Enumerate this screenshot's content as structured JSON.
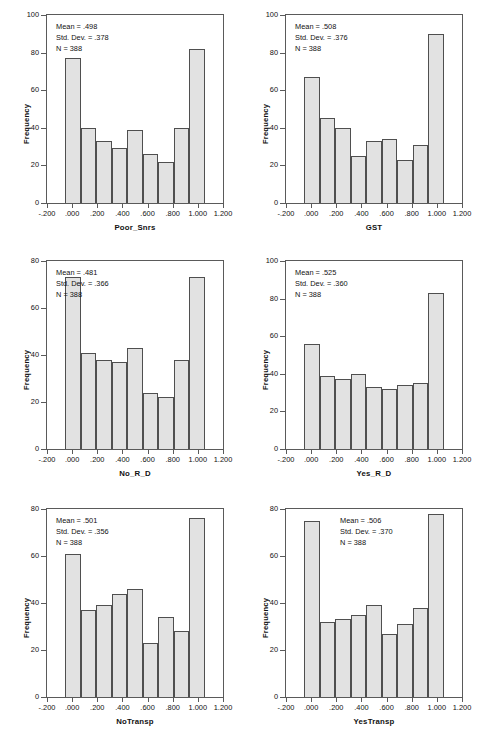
{
  "figure": {
    "kind": "histogram-grid",
    "rows": 3,
    "cols": 2,
    "background": "#ffffff",
    "bar_fill": "#e2e2e2",
    "bar_stroke": "#4f4f4f",
    "axis_color": "#5a5a5a"
  },
  "labels": {
    "y_axis_title": "Frequency",
    "mean_prefix": "Mean = ",
    "sd_prefix": "Std. Dev. = ",
    "n_prefix": "N = "
  },
  "chart_data": [
    {
      "type": "bar",
      "panel": 1,
      "title": "",
      "xlabel": "Poor_Snrs",
      "ylabel": "Frequency",
      "stats": {
        "mean": ".498",
        "std_dev": ".378",
        "n": "388"
      },
      "stats_text": [
        "Mean = .498",
        "Std. Dev. = .378",
        "N = 388"
      ],
      "stats_position": "left",
      "xlim": [
        -0.2,
        1.2
      ],
      "ylim": [
        0,
        100
      ],
      "yticks": [
        0,
        20,
        40,
        60,
        80,
        100
      ],
      "ytick_labels": [
        "0",
        "20",
        "40",
        "60",
        "80",
        "100"
      ],
      "xticks": [
        -0.2,
        0.0,
        0.2,
        0.4,
        0.6,
        0.8,
        1.0,
        1.2
      ],
      "xtick_labels": [
        "-.200",
        ".000",
        ".200",
        ".400",
        ".600",
        ".800",
        "1.000",
        "1.200"
      ],
      "bin_edges": [
        -0.0556,
        0.0556,
        0.1667,
        0.2778,
        0.3889,
        0.5,
        0.6111,
        0.7222,
        0.8333,
        1.0556
      ],
      "bin_centers": [
        0.0,
        0.111,
        0.222,
        0.333,
        0.444,
        0.556,
        0.667,
        0.778,
        0.944
      ],
      "values": [
        77,
        40,
        33,
        29,
        39,
        26,
        22,
        40,
        82
      ],
      "grid": false,
      "legend": "none"
    },
    {
      "type": "bar",
      "panel": 2,
      "title": "",
      "xlabel": "GST",
      "ylabel": "Frequency",
      "stats": {
        "mean": ".508",
        "std_dev": ".376",
        "n": "388"
      },
      "stats_text": [
        "Mean = .508",
        "Std. Dev. = .376",
        "N = 388"
      ],
      "stats_position": "left",
      "xlim": [
        -0.2,
        1.2
      ],
      "ylim": [
        0,
        100
      ],
      "yticks": [
        0,
        20,
        40,
        60,
        80,
        100
      ],
      "ytick_labels": [
        "0",
        "20",
        "40",
        "60",
        "80",
        "100"
      ],
      "xticks": [
        -0.2,
        0.0,
        0.2,
        0.4,
        0.6,
        0.8,
        1.0,
        1.2
      ],
      "xtick_labels": [
        "-.200",
        ".000",
        ".200",
        ".400",
        ".600",
        ".800",
        "1.000",
        "1.200"
      ],
      "values": [
        67,
        45,
        40,
        25,
        33,
        34,
        23,
        31,
        90
      ],
      "grid": false,
      "legend": "none"
    },
    {
      "type": "bar",
      "panel": 3,
      "title": "",
      "xlabel": "No_R_D",
      "ylabel": "Frequency",
      "stats": {
        "mean": ".481",
        "std_dev": ".366",
        "n": "388"
      },
      "stats_text": [
        "Mean = .481",
        "Std. Dev. = .366",
        "N = 388"
      ],
      "stats_position": "left",
      "xlim": [
        -0.2,
        1.2
      ],
      "ylim": [
        0,
        80
      ],
      "yticks": [
        0,
        20,
        40,
        60,
        80
      ],
      "ytick_labels": [
        "0",
        "20",
        "40",
        "60",
        "80"
      ],
      "xticks": [
        -0.2,
        0.0,
        0.2,
        0.4,
        0.6,
        0.8,
        1.0,
        1.2
      ],
      "xtick_labels": [
        "-.200",
        ".000",
        ".200",
        ".400",
        ".600",
        ".800",
        "1.000",
        "1.200"
      ],
      "values": [
        73,
        41,
        38,
        37,
        43,
        24,
        22,
        38,
        73
      ],
      "grid": false,
      "legend": "none"
    },
    {
      "type": "bar",
      "panel": 4,
      "title": "",
      "xlabel": "Yes_R_D",
      "ylabel": "Frequency",
      "stats": {
        "mean": ".525",
        "std_dev": ".360",
        "n": "388"
      },
      "stats_text": [
        "Mean = .525",
        "Std. Dev. = .360",
        "N = 388"
      ],
      "stats_position": "left",
      "xlim": [
        -0.2,
        1.2
      ],
      "ylim": [
        0,
        100
      ],
      "yticks": [
        0,
        20,
        40,
        60,
        80,
        100
      ],
      "ytick_labels": [
        "0",
        "20",
        "40",
        "60",
        "80",
        "100"
      ],
      "xticks": [
        -0.2,
        0.0,
        0.2,
        0.4,
        0.6,
        0.8,
        1.0,
        1.2
      ],
      "xtick_labels": [
        "-.200",
        ".000",
        ".200",
        ".400",
        ".600",
        ".800",
        "1.000",
        "1.200"
      ],
      "values": [
        56,
        39,
        37,
        40,
        33,
        32,
        34,
        35,
        83
      ],
      "grid": false,
      "legend": "none"
    },
    {
      "type": "bar",
      "panel": 5,
      "title": "",
      "xlabel": "NoTransp",
      "ylabel": "Frequency",
      "stats": {
        "mean": ".501",
        "std_dev": ".356",
        "n": "388"
      },
      "stats_text": [
        "Mean = .501",
        "Std. Dev. = .356",
        "N = 388"
      ],
      "stats_position": "left",
      "xlim": [
        -0.2,
        1.2
      ],
      "ylim": [
        0,
        80
      ],
      "yticks": [
        0,
        20,
        40,
        60,
        80
      ],
      "ytick_labels": [
        "0",
        "20",
        "40",
        "60",
        "80"
      ],
      "xticks": [
        -0.2,
        0.0,
        0.2,
        0.4,
        0.6,
        0.8,
        1.0,
        1.2
      ],
      "xtick_labels": [
        "-.200",
        ".000",
        ".200",
        ".400",
        ".600",
        ".800",
        "1.000",
        "1.200"
      ],
      "values": [
        61,
        37,
        39,
        44,
        46,
        23,
        34,
        28,
        76
      ],
      "grid": false,
      "legend": "none"
    },
    {
      "type": "bar",
      "panel": 6,
      "title": "",
      "xlabel": "YesTransp",
      "ylabel": "Frequency",
      "stats": {
        "mean": ".506",
        "std_dev": ".370",
        "n": "388"
      },
      "stats_text": [
        "Mean = .506",
        "Std. Dev. = .370",
        "N = 388"
      ],
      "stats_position": "right",
      "xlim": [
        -0.2,
        1.2
      ],
      "ylim": [
        0,
        80
      ],
      "yticks": [
        0,
        20,
        40,
        60,
        80
      ],
      "ytick_labels": [
        "0",
        "20",
        "40",
        "60",
        "80"
      ],
      "xticks": [
        -0.2,
        0.0,
        0.2,
        0.4,
        0.6,
        0.8,
        1.0,
        1.2
      ],
      "xtick_labels": [
        "-.200",
        ".000",
        ".200",
        ".400",
        ".600",
        ".800",
        "1.000",
        "1.200"
      ],
      "values": [
        75,
        32,
        33,
        35,
        39,
        27,
        31,
        38,
        78
      ],
      "grid": false,
      "legend": "none"
    }
  ]
}
